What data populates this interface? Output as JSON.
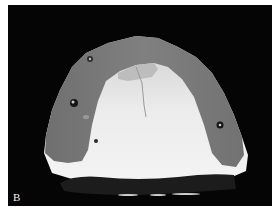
{
  "figure": {
    "panel_label": "B",
    "colors": {
      "background": "#050505",
      "border": "#ffffff",
      "gum_gray": "#7b7b7b",
      "stone_white": "#e6e6e6"
    }
  }
}
